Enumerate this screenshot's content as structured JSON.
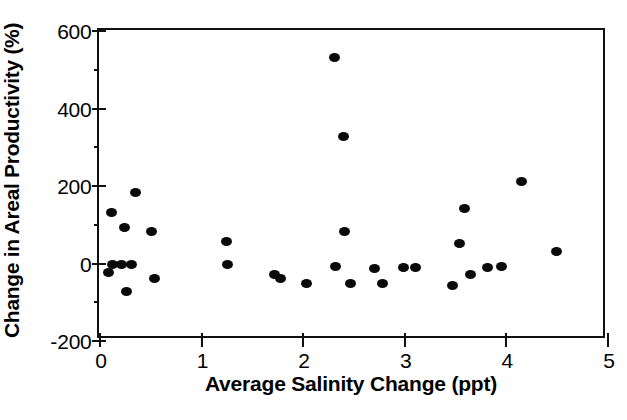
{
  "chart_data": {
    "type": "scatter",
    "title": "",
    "xlabel": "Average Salinity Change (ppt)",
    "ylabel": "Change in Areal Productivity (%)",
    "xlim": [
      0,
      5
    ],
    "ylim": [
      -200,
      600
    ],
    "xticks": [
      0,
      1,
      2,
      3,
      4,
      5
    ],
    "xtick_labels": [
      "0",
      "1",
      "2",
      "3",
      "4",
      "5"
    ],
    "yticks": [
      -200,
      0,
      200,
      400,
      600
    ],
    "ytick_labels": [
      "-200",
      "0",
      "200",
      "400",
      "600"
    ],
    "y_minor_ticks": [
      500,
      300,
      100,
      -100
    ],
    "grid": false,
    "legend": null,
    "marker": {
      "shape": "circle",
      "color": "#0a0a0a",
      "size_px": 10
    },
    "series": [
      {
        "name": "Sites",
        "color": "#0a0a0a",
        "n_points": 36,
        "points": [
          {
            "x": 0.09,
            "y": -25
          },
          {
            "x": 0.12,
            "y": 130
          },
          {
            "x": 0.13,
            "y": -5
          },
          {
            "x": 0.22,
            "y": -5
          },
          {
            "x": 0.25,
            "y": 90
          },
          {
            "x": 0.27,
            "y": -75
          },
          {
            "x": 0.32,
            "y": -5
          },
          {
            "x": 0.36,
            "y": 180
          },
          {
            "x": 0.52,
            "y": 80
          },
          {
            "x": 0.55,
            "y": -40
          },
          {
            "x": 1.25,
            "y": 55
          },
          {
            "x": 1.26,
            "y": -5
          },
          {
            "x": 1.73,
            "y": -30
          },
          {
            "x": 1.79,
            "y": -40
          },
          {
            "x": 2.04,
            "y": -55
          },
          {
            "x": 2.32,
            "y": 530
          },
          {
            "x": 2.33,
            "y": -10
          },
          {
            "x": 2.41,
            "y": 325
          },
          {
            "x": 2.42,
            "y": 80
          },
          {
            "x": 2.48,
            "y": -55
          },
          {
            "x": 2.71,
            "y": -15
          },
          {
            "x": 2.79,
            "y": -55
          },
          {
            "x": 3.0,
            "y": -12
          },
          {
            "x": 3.12,
            "y": -12
          },
          {
            "x": 3.48,
            "y": -60
          },
          {
            "x": 3.55,
            "y": 50
          },
          {
            "x": 3.6,
            "y": 140
          },
          {
            "x": 3.66,
            "y": -30
          },
          {
            "x": 3.82,
            "y": -12
          },
          {
            "x": 3.96,
            "y": -10
          },
          {
            "x": 4.16,
            "y": 210
          },
          {
            "x": 4.5,
            "y": 28
          }
        ]
      }
    ]
  },
  "axes": {
    "x_title": "Average Salinity Change (ppt)",
    "y_title": "Change in Areal Productivity (%)"
  }
}
